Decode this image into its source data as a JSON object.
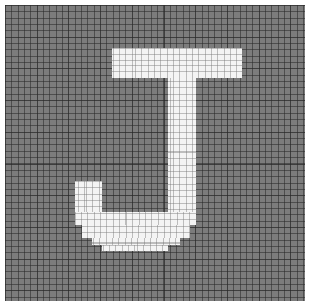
{
  "canvas": {
    "description": "pixel grid showing letter J",
    "letter": "J",
    "grid_color": "#7c7c7c",
    "fill_color": "#f4f4f4",
    "cells_approx": 47
  },
  "blocks": [
    {
      "name": "top-bar",
      "x": 112,
      "y": 48,
      "w": 130,
      "h": 30
    },
    {
      "name": "stem",
      "x": 168,
      "y": 78,
      "w": 28,
      "h": 147
    },
    {
      "name": "hook-left",
      "x": 75,
      "y": 181,
      "w": 27,
      "h": 44
    },
    {
      "name": "curve-row-1",
      "x": 82,
      "y": 225,
      "w": 108,
      "h": 13
    },
    {
      "name": "curve-row-1b",
      "x": 75,
      "y": 225,
      "w": 7,
      "h": 0
    },
    {
      "name": "curve-row-2",
      "x": 92,
      "y": 238,
      "w": 88,
      "h": 7
    },
    {
      "name": "curve-row-3",
      "x": 102,
      "y": 245,
      "w": 66,
      "h": 6
    },
    {
      "name": "hook-bottom",
      "x": 75,
      "y": 212,
      "w": 121,
      "h": 13
    }
  ]
}
